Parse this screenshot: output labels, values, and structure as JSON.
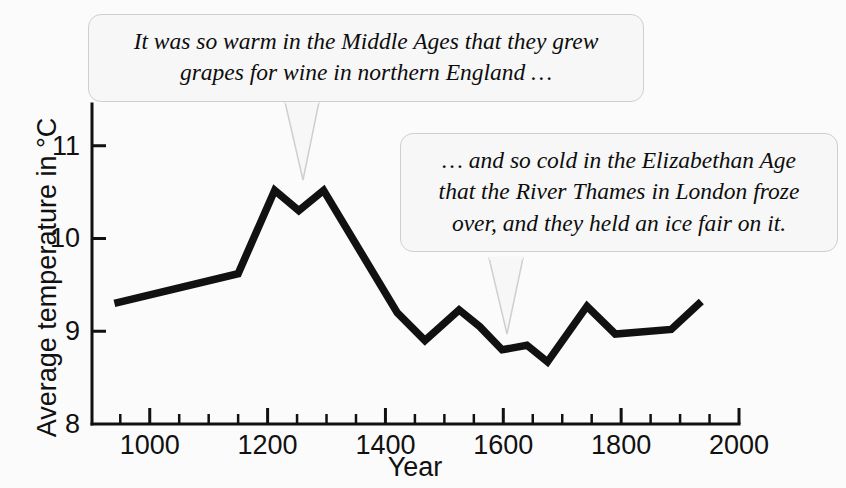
{
  "figure": {
    "background_color": "#fbfbfb",
    "line_color": "#111111",
    "bubble_fill": "#f7f7f7",
    "bubble_border": "#cfcfcf"
  },
  "annotations": {
    "medieval": {
      "line1": "It was so warm in the Middle Ages that they grew",
      "line2": "grapes for wine in northern England …"
    },
    "elizabethan": {
      "line1": "… and so cold in the Elizabethan Age",
      "line2": "that the River Thames in London froze",
      "line3": "over, and they held an ice fair on it."
    }
  },
  "chart_data": {
    "type": "line",
    "title": "",
    "xlabel": "Year",
    "ylabel": "Average temperature in °C",
    "xlim": [
      902,
      2000
    ],
    "ylim": [
      8,
      11.45
    ],
    "grid": false,
    "legend": null,
    "x_ticks_major": [
      1000,
      1200,
      1400,
      1600,
      1800,
      2000
    ],
    "x_ticks_minor_step": 50,
    "y_ticks_major": [
      8,
      9,
      10,
      11
    ],
    "x_tick_labels": [
      "1000",
      "1200",
      "1400",
      "1600",
      "1800",
      "2000"
    ],
    "y_tick_labels": [
      "8",
      "9",
      "10",
      "11"
    ],
    "series": [
      {
        "name": "Average temperature",
        "color": "#111111",
        "x": [
          940,
          1150,
          1212,
          1253,
          1295,
          1420,
          1467,
          1525,
          1560,
          1598,
          1640,
          1675,
          1742,
          1790,
          1885,
          1936
        ],
        "values": [
          9.3,
          9.62,
          10.52,
          10.3,
          10.52,
          9.2,
          8.9,
          9.23,
          9.05,
          8.8,
          8.85,
          8.67,
          9.27,
          8.97,
          9.02,
          9.32
        ]
      }
    ]
  }
}
